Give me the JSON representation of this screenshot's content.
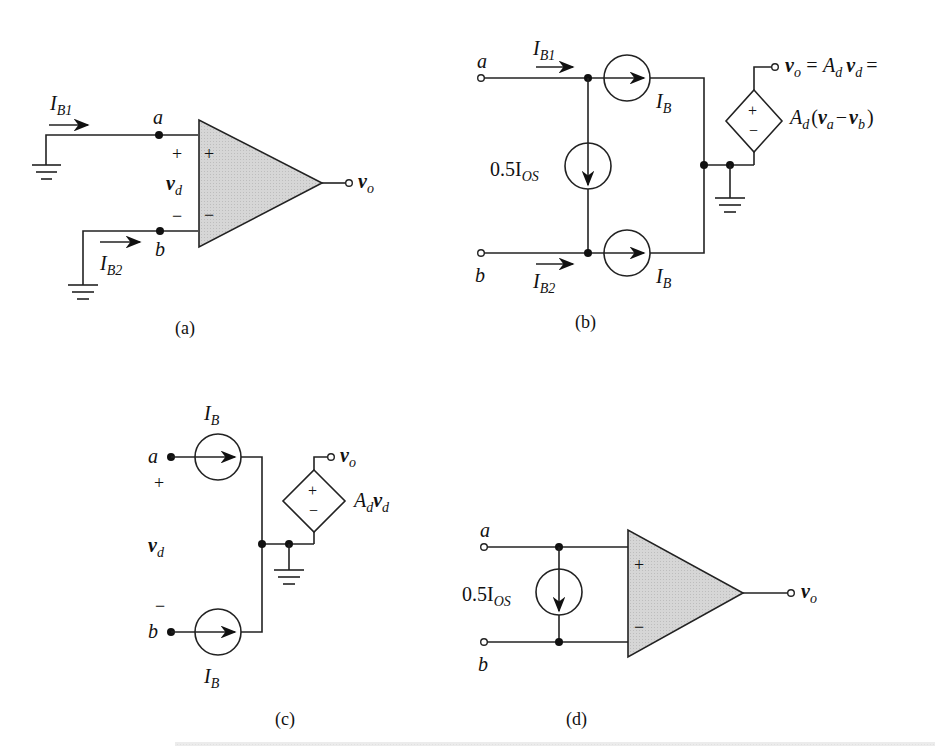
{
  "figure": {
    "panels": [
      {
        "id": "a",
        "caption": "(a)"
      },
      {
        "id": "b",
        "caption": "(b)"
      },
      {
        "id": "c",
        "caption": "(c)"
      },
      {
        "id": "d",
        "caption": "(d)"
      }
    ]
  },
  "panel_a": {
    "ib1": "I",
    "ib1_sub": "B1",
    "ib2": "I",
    "ib2_sub": "B2",
    "node_a": "a",
    "node_b": "b",
    "plus_outer": "+",
    "minus_outer": "−",
    "vd": "v",
    "vd_sub": "d",
    "plus_in": "+",
    "minus_in": "−",
    "vo": "v",
    "vo_sub": "o",
    "caption": "(a)"
  },
  "panel_b": {
    "node_a": "a",
    "node_b": "b",
    "ib1": "I",
    "ib1_sub": "B1",
    "ib2": "I",
    "ib2_sub": "B2",
    "ib_top": "I",
    "ib_top_sub": "B",
    "ib_bot": "I",
    "ib_bot_sub": "B",
    "ios": "0.5I",
    "ios_sub": "OS",
    "plus": "+",
    "minus": "−",
    "eq1": "= A",
    "eq1_sub": "d",
    "eq1_v": "v",
    "eq1_vsub": "d",
    "eq1_end": "=",
    "vo": "v",
    "vo_sub": "o",
    "eq2_a": "A",
    "eq2_a_sub": "d",
    "eq2_open": "(",
    "eq2_va": "v",
    "eq2_va_sub": "a",
    "eq2_minus": "−",
    "eq2_vb": "v",
    "eq2_vb_sub": "b",
    "eq2_close": ")",
    "caption": "(b)"
  },
  "panel_c": {
    "ib_top": "I",
    "ib_top_sub": "B",
    "ib_bot": "I",
    "ib_bot_sub": "B",
    "node_a": "a",
    "node_b": "b",
    "plus_outer": "+",
    "minus_outer": "−",
    "vd": "v",
    "vd_sub": "d",
    "plus": "+",
    "minus": "−",
    "vo": "v",
    "vo_sub": "o",
    "gain": "A",
    "gain_sub": "d",
    "gain_v": "v",
    "gain_vsub": "d",
    "caption": "(c)"
  },
  "panel_d": {
    "node_a": "a",
    "node_b": "b",
    "ios": "0.5I",
    "ios_sub": "OS",
    "plus_in": "+",
    "minus_in": "−",
    "vo": "v",
    "vo_sub": "o",
    "caption": "(d)"
  },
  "colors": {
    "opamp_fill": "#d9d9d9",
    "line": "#222222"
  }
}
